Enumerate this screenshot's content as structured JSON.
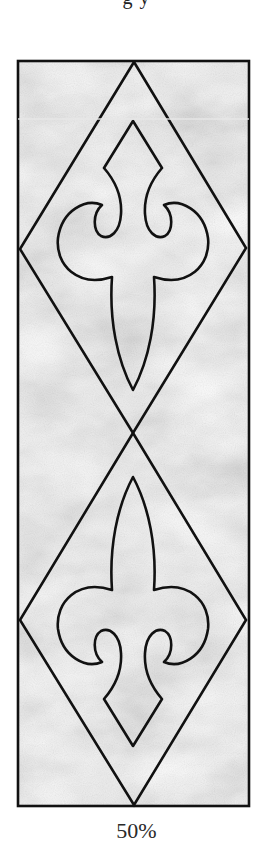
{
  "figure": {
    "top_cut_text": "g        y",
    "caption": "50%",
    "colors": {
      "panel_fill": "#aaaaaa",
      "panel_light": "#c4c4c4",
      "line": "#111111",
      "background": "#ffffff",
      "scan_line": "#e6e6e6"
    }
  }
}
